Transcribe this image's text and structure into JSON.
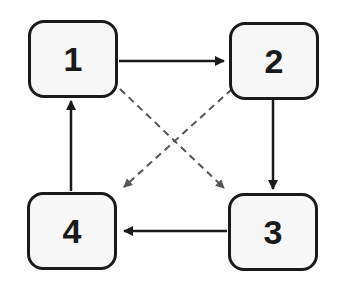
{
  "diagram": {
    "nodes": [
      {
        "id": "1",
        "label": "1",
        "x": 28,
        "y": 20,
        "w": 90,
        "h": 78
      },
      {
        "id": "2",
        "label": "2",
        "x": 229,
        "y": 22,
        "w": 90,
        "h": 78
      },
      {
        "id": "3",
        "label": "3",
        "x": 228,
        "y": 193,
        "w": 90,
        "h": 78
      },
      {
        "id": "4",
        "label": "4",
        "x": 27,
        "y": 192,
        "w": 90,
        "h": 78
      }
    ],
    "edges": [
      {
        "from": "1",
        "to": "2",
        "style": "solid"
      },
      {
        "from": "2",
        "to": "3",
        "style": "solid"
      },
      {
        "from": "3",
        "to": "4",
        "style": "solid"
      },
      {
        "from": "4",
        "to": "1",
        "style": "solid"
      },
      {
        "from": "1",
        "to": "3",
        "style": "dashed"
      },
      {
        "from": "2",
        "to": "4",
        "style": "dashed"
      }
    ],
    "colors": {
      "solid": "#1a1a1a",
      "dashed": "#555555",
      "node_fill": "#f7f7f7",
      "node_border": "#1a1a1a"
    }
  }
}
